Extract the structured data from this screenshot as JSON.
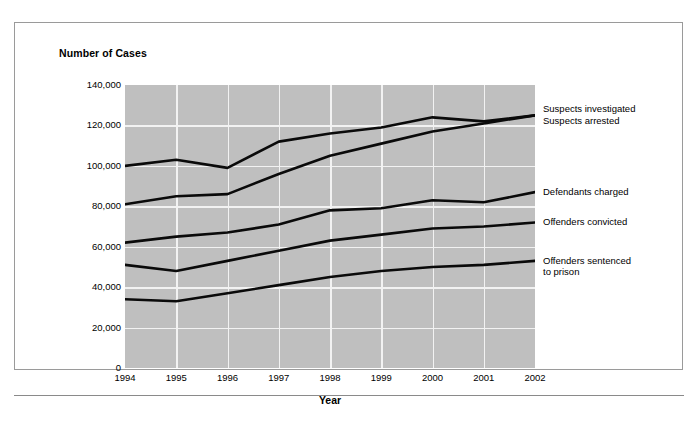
{
  "figure": {
    "y_axis_title": "Number of Cases",
    "x_axis_title": "Year"
  },
  "chart_data": {
    "type": "line",
    "title": "",
    "xlabel": "Year",
    "ylabel": "Number of Cases",
    "x": [
      "1994",
      "1995",
      "1996",
      "1997",
      "1998",
      "1999",
      "2000",
      "2001",
      "2002"
    ],
    "categories": [
      "1994",
      "1995",
      "1996",
      "1997",
      "1998",
      "1999",
      "2000",
      "2001",
      "2002"
    ],
    "ylim": [
      0,
      140000
    ],
    "ytick_labels": [
      "140,000",
      "120,000",
      "100,000",
      "80,000",
      "60,000",
      "40,000",
      "20,000",
      "0"
    ],
    "ytick_values": [
      140000,
      120000,
      100000,
      80000,
      60000,
      40000,
      20000,
      0
    ],
    "grid": true,
    "legend_position": "right-inline",
    "series": [
      {
        "name": "Suspects investigated",
        "label_lines": "Suspects investigated",
        "values": [
          100000,
          103000,
          99000,
          112000,
          116000,
          119000,
          124000,
          122000,
          125000
        ]
      },
      {
        "name": "Suspects arrested",
        "label_lines": "Suspects arrested",
        "values": [
          81000,
          85000,
          86000,
          96000,
          105000,
          111000,
          117000,
          121000,
          125000
        ]
      },
      {
        "name": "Defendants charged",
        "label_lines": "Defendants charged",
        "values": [
          62000,
          65000,
          67000,
          71000,
          78000,
          79000,
          83000,
          82000,
          87000
        ]
      },
      {
        "name": "Offenders convicted",
        "label_lines": "Offenders convicted",
        "values": [
          51000,
          48000,
          53000,
          58000,
          63000,
          66000,
          69000,
          70000,
          72000
        ]
      },
      {
        "name": "Offenders sentenced to prison",
        "label_lines": "Offenders sentenced\nto prison",
        "values": [
          34000,
          33000,
          37000,
          41000,
          45000,
          48000,
          50000,
          51000,
          53000
        ]
      }
    ]
  }
}
